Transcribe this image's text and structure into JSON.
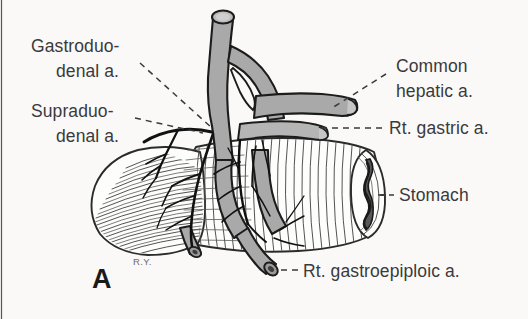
{
  "figure": {
    "panel_letter": "A",
    "signature": "R.Y.",
    "background_color": "#faf9f7",
    "artery_color": "#a9a9a9",
    "outline_color": "#1c1c1c",
    "label_color": "#3a3a3c"
  },
  "labels": {
    "gastroduodenal_line1": "Gastroduo-",
    "gastroduodenal_line2": "denal a.",
    "supraduodenal_line1": "Supraduo-",
    "supraduodenal_line2": "denal a.",
    "common_hepatic_line1": "Common",
    "common_hepatic_line2": "hepatic a.",
    "right_gastric": "Rt. gastric a.",
    "stomach": "Stomach",
    "right_gastroepiploic": "Rt. gastroepiploic a."
  },
  "structures": [
    {
      "name": "common-hepatic-artery",
      "label": "Common hepatic a."
    },
    {
      "name": "gastroduodenal-artery",
      "label": "Gastroduodenal a."
    },
    {
      "name": "supraduodenal-artery",
      "label": "Supraduodenal a."
    },
    {
      "name": "right-gastric-artery",
      "label": "Rt. gastric a."
    },
    {
      "name": "right-gastroepiploic-artery",
      "label": "Rt. gastroepiploic a."
    },
    {
      "name": "stomach",
      "label": "Stomach"
    },
    {
      "name": "duodenum",
      "label": "Duodenum"
    }
  ]
}
